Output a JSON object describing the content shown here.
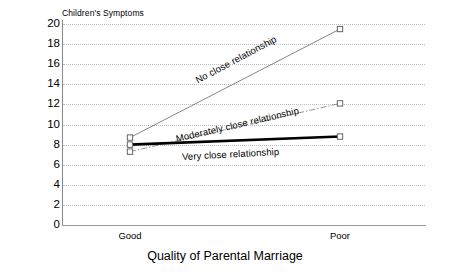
{
  "chart_data": {
    "type": "line",
    "title": "",
    "ylabel": "Children's Symptoms",
    "xlabel": "Quality of Parental Marriage",
    "categories": [
      "Good",
      "Poor"
    ],
    "ylim": [
      0,
      20
    ],
    "yticks": [
      0,
      2,
      4,
      6,
      8,
      10,
      12,
      14,
      16,
      18,
      20
    ],
    "grid": "horizontal-dotted",
    "legend": "inline-annotations",
    "series": [
      {
        "name": "No close relationship",
        "values": [
          8.7,
          19.5
        ],
        "style": "thin-solid",
        "color": "#777777",
        "marker": "open-square"
      },
      {
        "name": "Moderately close relationship",
        "values": [
          7.3,
          12.1
        ],
        "style": "dash-dot",
        "color": "#888888",
        "marker": "open-square"
      },
      {
        "name": "Very close relationship",
        "values": [
          8.0,
          8.8
        ],
        "style": "thick-solid",
        "color": "#000000",
        "marker": "open-square"
      }
    ]
  },
  "axes": {
    "y_title": "Children's Symptoms",
    "x_title": "Quality of Parental Marriage",
    "y_tick_labels": [
      "20",
      "18",
      "16",
      "14",
      "12",
      "10",
      "8",
      "6",
      "4",
      "2",
      "0"
    ],
    "x_tick_labels": [
      "Good",
      "Poor"
    ]
  },
  "annotations": [
    {
      "text": "No close relationship",
      "x": 196,
      "y": 75,
      "rotation": -28
    },
    {
      "text": "Moderately close relationship",
      "x": 176,
      "y": 133,
      "rotation": -13
    },
    {
      "text": "Very close relationship",
      "x": 182,
      "y": 151,
      "rotation": -3
    }
  ],
  "colors": {
    "background": "#ffffff",
    "text": "#000000",
    "grid": "#bdbdbd",
    "axis": "#8a8a8a",
    "series_strong": "#000000",
    "series_light": "#777777"
  }
}
